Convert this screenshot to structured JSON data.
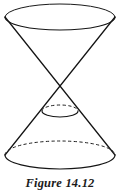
{
  "figure": {
    "caption": "Figure 14.12",
    "alt_description": "Double cone (two nappes) with horizontal cross-section ellipses",
    "background_color": "#ffffff",
    "line_color": "#151515"
  },
  "geometry": {
    "apex": {
      "x": 60,
      "y": 90
    },
    "top_ellipse": {
      "name": "top-rim-ellipse",
      "cx": 60,
      "cy": 17,
      "rx": 55,
      "ry": 13,
      "back_arc_style": "solid",
      "front_arc_style": "solid"
    },
    "middle_ellipse": {
      "name": "upper-cross-section-ellipse",
      "cx": 60,
      "cy": 111,
      "rx": 18,
      "ry": 6,
      "back_arc_style": "dashed",
      "front_arc_style": "solid"
    },
    "bottom_ellipse": {
      "name": "bottom-rim-ellipse",
      "cx": 60,
      "cy": 155,
      "rx": 55,
      "ry": 14,
      "back_arc_style": "dashed",
      "front_arc_style": "solid"
    },
    "generators": [
      {
        "name": "generator-left-to-right",
        "x1": 5,
        "y1": 17,
        "x2": 115,
        "y2": 155
      },
      {
        "name": "generator-right-to-left",
        "x1": 115,
        "y1": 17,
        "x2": 5,
        "y2": 155
      }
    ]
  }
}
